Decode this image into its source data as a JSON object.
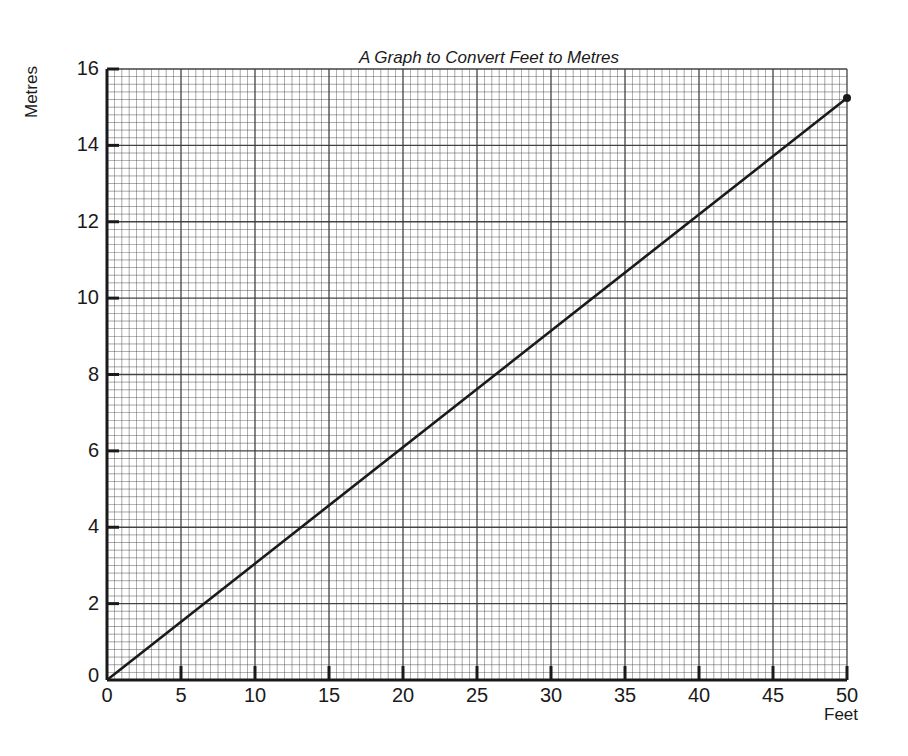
{
  "chart_data": {
    "type": "line",
    "title": "A Graph to Convert Feet to Metres",
    "xlabel": "Feet",
    "ylabel": "Metres",
    "xlim": [
      0,
      50
    ],
    "ylim": [
      0,
      16
    ],
    "x_ticks": [
      "0",
      "5",
      "10",
      "15",
      "20",
      "25",
      "30",
      "35",
      "40",
      "45",
      "50"
    ],
    "y_ticks": [
      "0",
      "2",
      "4",
      "6",
      "8",
      "10",
      "12",
      "14",
      "16"
    ],
    "grid": true,
    "grid_minor_x_step": 0.5,
    "grid_minor_y_step": 0.2,
    "series": [
      {
        "name": "Feet to Metres",
        "x": [
          0,
          50
        ],
        "y": [
          0,
          15.24
        ],
        "color": "#1a1a1a",
        "endpoint_marker": true
      }
    ],
    "legend": null
  },
  "labels": {
    "title": "A Graph to Convert Feet to Metres",
    "xlabel": "Feet",
    "ylabel": "Metres"
  },
  "colors": {
    "grid": "#3a3a3a",
    "axis": "#1a1a1a",
    "line": "#1a1a1a",
    "background": "#ffffff"
  }
}
